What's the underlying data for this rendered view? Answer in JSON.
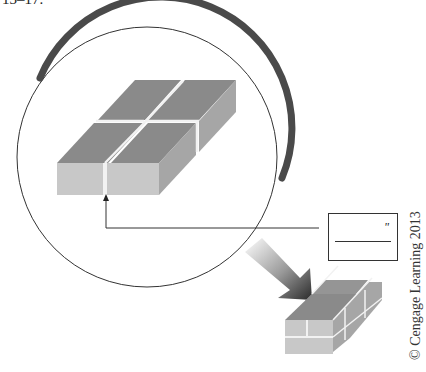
{
  "problem": {
    "number": "13–17."
  },
  "answer_box": {
    "unit_mark": "\"",
    "value": ""
  },
  "credit": {
    "text": "© Cengage Learning 2013"
  },
  "colors": {
    "brick_top": "#8a8a8a",
    "brick_front": "#c8c8c8",
    "brick_side": "#a6a6a6",
    "mortar": "#f2f2f2",
    "circle_arc": "#4a4a4a",
    "outline": "#333333"
  }
}
